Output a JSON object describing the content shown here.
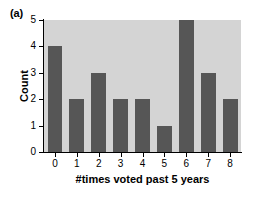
{
  "panel": {
    "label": "(a)"
  },
  "colors": {
    "page_background": "#ffffff",
    "plot_background": "#d4d4d4",
    "bar_fill": "#565656",
    "axis": "#000000",
    "text": "#000000"
  },
  "chart_data": {
    "type": "bar",
    "title": "",
    "subtitle": "",
    "xlabel": "#times voted past 5 years",
    "ylabel": "Count",
    "categories": [
      "0",
      "1",
      "2",
      "3",
      "4",
      "5",
      "6",
      "7",
      "8"
    ],
    "values": [
      4,
      2,
      3,
      2,
      2,
      1,
      5,
      3,
      2
    ],
    "xtick_labels": [
      "0",
      "1",
      "2",
      "3",
      "4",
      "5",
      "6",
      "7",
      "8"
    ],
    "ytick_labels": [
      "0",
      "1",
      "2",
      "3",
      "4",
      "5"
    ],
    "ytick_values": [
      0,
      1,
      2,
      3,
      4,
      5
    ],
    "ylim": [
      0,
      5
    ],
    "grid": false,
    "legend": false,
    "legend_position": "none",
    "annotations": [
      "(a)"
    ]
  }
}
